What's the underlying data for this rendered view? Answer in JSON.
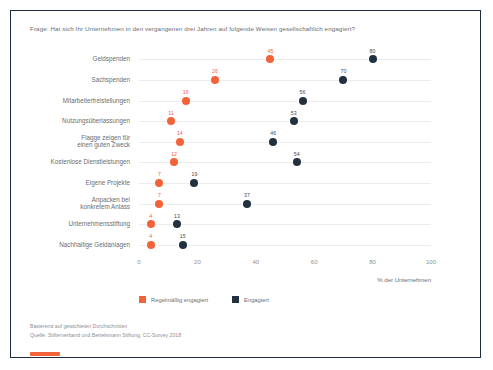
{
  "question": "Frage: Hat sich Ihr Unternehmen in den vergangenen drei Jahren auf folgende Weisen gesellschaftlich engagiert?",
  "legend": {
    "items": [
      {
        "label": "Regelmäßig engagiert",
        "color": "#f4623a"
      },
      {
        "label": "Engagiert",
        "color": "#22313f"
      }
    ]
  },
  "notes": {
    "line1": "Basierend auf gewichteten Durchschnitten",
    "line2": "Quelle: Stifterverband und Bertelsmann Stiftung, CC-Survey 2018"
  },
  "logo": {
    "name": "orange-bar-logo",
    "color": "#f4623a"
  },
  "chart_data": {
    "type": "scatter",
    "title": "Frage: Hat sich Ihr Unternehmen in den vergangenen drei Jahren auf folgende Weisen gesellschaftlich engagiert?",
    "xlabel": "% der Unternehmen",
    "ylabel": "",
    "xlim": [
      0,
      100
    ],
    "xticks": [
      0,
      20,
      40,
      60,
      80,
      100
    ],
    "grid": true,
    "legend_position": "bottom-left",
    "categories": [
      "Geldspenden",
      "Sachspenden",
      "Mitarbeiterfreistellungen",
      "Nutzungsüberlassungen",
      "Flagge zeigen für\neinen guten Zweck",
      "Kostenlose Dienstleistungen",
      "Eigene Projekte",
      "Anpacken bei\nkonkretem Anlass",
      "Unternehmensstiftung",
      "Nachhaltige Geldanlagen"
    ],
    "series": [
      {
        "name": "Regelmäßig engagiert",
        "color": "#f4623a",
        "values": [
          45,
          26,
          16,
          11,
          14,
          12,
          7,
          7,
          4,
          4
        ]
      },
      {
        "name": "Engagiert",
        "color": "#22313f",
        "values": [
          80,
          70,
          56,
          53,
          46,
          54,
          19,
          37,
          13,
          15
        ]
      }
    ]
  }
}
